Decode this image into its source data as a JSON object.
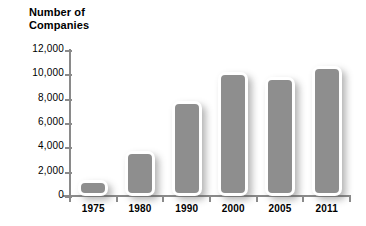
{
  "chart_data": {
    "type": "bar",
    "title": "Number of\nCompanies",
    "xlabel": "",
    "ylabel": "Number of Companies",
    "categories": [
      "1975",
      "1980",
      "1990",
      "2000",
      "2005",
      "2011"
    ],
    "values": [
      1300,
      3700,
      7800,
      10200,
      9800,
      10700
    ],
    "ylim": [
      0,
      12000
    ],
    "ytick_labels": [
      "0",
      "2,000",
      "4,000",
      "6,000",
      "8,000",
      "10,000",
      "12,000"
    ],
    "ytick_values": [
      0,
      2000,
      4000,
      6000,
      8000,
      10000,
      12000
    ],
    "grid": false,
    "legend": null,
    "series": [
      {
        "name": "Number of Companies",
        "values": [
          1300,
          3700,
          7800,
          10200,
          9800,
          10700
        ]
      }
    ]
  },
  "style": {
    "bar_fill": "#8e8e8e",
    "bar_outline": "#ffffff",
    "axis_color": "#8a8a8a",
    "text_color": "#000000",
    "background": "#ffffff"
  }
}
